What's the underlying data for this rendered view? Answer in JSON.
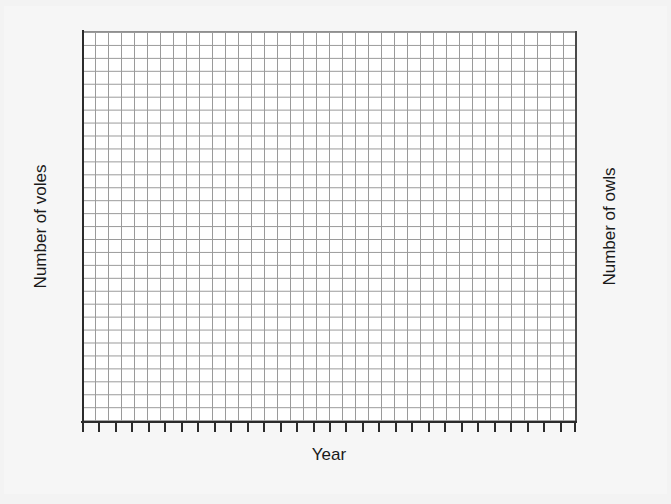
{
  "chart_data": {
    "type": "line",
    "title": "",
    "subtitle": "",
    "xlabel": "Year",
    "ylabel_left": "Number of voles",
    "ylabel_right": "Number of owls",
    "series": [],
    "categories": [],
    "values": [],
    "annotations": [],
    "legend": {
      "entries": [],
      "position": "none"
    },
    "grid": {
      "visible": true,
      "columns": 38,
      "rows": 30,
      "cell_width_px": 13,
      "cell_height_px": 13,
      "line_color": "#9a9a9a",
      "background": "#ffffff"
    },
    "axes": {
      "left": {
        "label": "Number of voles",
        "tick_labels": [],
        "spine_color": "#2b2b2b",
        "orientation": "vertical"
      },
      "right": {
        "label": "Number of owls",
        "tick_labels": [],
        "spine_color": "#4a4a4a",
        "orientation": "vertical"
      },
      "bottom": {
        "label": "Year",
        "tick_labels": [],
        "tick_count": 31,
        "spine_color": "#2b2b2b",
        "orientation": "horizontal"
      }
    }
  },
  "page": {
    "background_color": "#f3f3f3",
    "sheet_color": "#f6f6f6"
  },
  "labels": {
    "x_axis": "Year",
    "y_axis_left": "Number of voles",
    "y_axis_right": "Number of owls"
  }
}
